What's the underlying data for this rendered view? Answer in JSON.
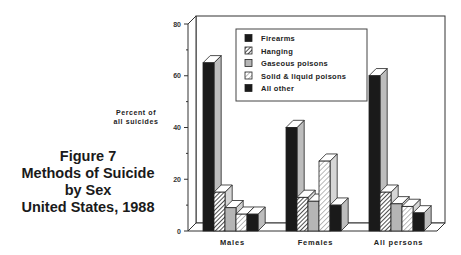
{
  "chart_data": {
    "type": "bar",
    "style": "3d-clustered",
    "title": "Figure 7",
    "subtitle": [
      "Methods of Suicide",
      "by Sex",
      "United States, 1988"
    ],
    "ylabel": [
      "Percent of",
      "all suicides"
    ],
    "xlabel": "",
    "ylim": [
      0,
      80
    ],
    "yticks": [
      0,
      20,
      40,
      60,
      80
    ],
    "grid": false,
    "legend_position": "upper-center-inside",
    "categories": [
      "Males",
      "Females",
      "All persons"
    ],
    "series": [
      {
        "name": "Firearms",
        "values": [
          65,
          40,
          60
        ],
        "fill": "#1a1a1a",
        "pattern": "solid"
      },
      {
        "name": "Hanging",
        "values": [
          15,
          13,
          15
        ],
        "fill": "#ffffff",
        "pattern": "hatch-dense"
      },
      {
        "name": "Gaseous poisons",
        "values": [
          9,
          11.5,
          10.5
        ],
        "fill": "#b5b5b5",
        "pattern": "solid"
      },
      {
        "name": "Solid & liquid poisons",
        "values": [
          6.5,
          27,
          9.5
        ],
        "fill": "#ffffff",
        "pattern": "hatch-light"
      },
      {
        "name": "All other",
        "values": [
          6.5,
          10,
          7
        ],
        "fill": "#1a1a1a",
        "pattern": "solid"
      }
    ]
  },
  "figure": {
    "label": "Figure 7",
    "title_lines": [
      "Methods of Suicide",
      "by Sex",
      "United States, 1988"
    ],
    "ylabel_lines": [
      "Percent of",
      "all suicides"
    ]
  }
}
